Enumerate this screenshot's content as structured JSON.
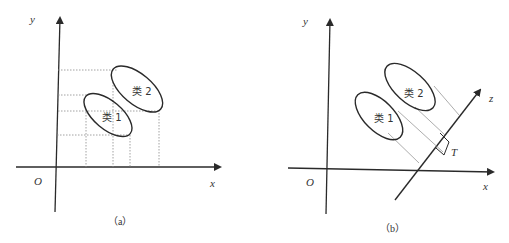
{
  "panels": [
    {
      "id": "a",
      "caption": "（a）",
      "axis_x_label": "x",
      "axis_y_label": "y",
      "origin_label": "O",
      "class1_label": "类 1",
      "class2_label": "类 2"
    },
    {
      "id": "b",
      "caption": "（b）",
      "axis_x_label": "x",
      "axis_y_label": "y",
      "axis_z_label": "z",
      "origin_label": "O",
      "class1_label": "类 1",
      "class2_label": "类 2",
      "threshold_label": "T"
    }
  ],
  "colors": {
    "stroke": "#2a2a2a",
    "guide": "#8a8a8a",
    "background": "#ffffff"
  }
}
